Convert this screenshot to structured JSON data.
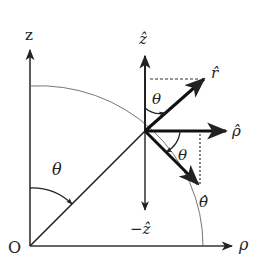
{
  "diagram": {
    "axes": {
      "z_label": "z",
      "rho_label": "ρ",
      "origin_label": "O"
    },
    "angle_labels": {
      "origin_theta": "θ",
      "upper_theta": "θ",
      "lower_theta": "θ"
    },
    "unit_vectors": {
      "z_hat": "ẑ",
      "r_hat": "r̂",
      "rho_hat": "ρ̂",
      "theta_hat": "θ̂",
      "neg_z_hat": "−ẑ"
    },
    "colors": {
      "line": "#222222",
      "thin_line": "#555555",
      "background": "#ffffff"
    }
  }
}
